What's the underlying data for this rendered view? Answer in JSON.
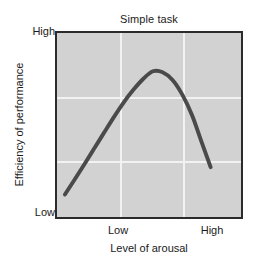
{
  "chart_data": {
    "type": "line",
    "title": "Simple task",
    "xlabel": "Level of arousal",
    "ylabel": "Efficiency of performance",
    "xtick_labels": [
      "Low",
      "High"
    ],
    "ytick_labels": [
      "Low",
      "High"
    ],
    "ytick_low": "Low",
    "ytick_high": "High",
    "xtick_low": "Low",
    "xtick_high": "High",
    "xlim": [
      0,
      1
    ],
    "ylim": [
      0,
      1
    ],
    "grid": true,
    "grid_x_fractions": [
      0.3351,
      0.6702
    ],
    "grid_y_fractions": [
      0.3191,
      0.6596
    ],
    "legend": null,
    "annotations": [],
    "series": [
      {
        "name": "Simple task performance",
        "color": "#4a4a4a",
        "line_width": 4,
        "x": [
          0.043,
          0.096,
          0.149,
          0.202,
          0.255,
          0.309,
          0.362,
          0.415,
          0.468,
          0.521,
          0.574,
          0.628,
          0.681,
          0.734,
          0.787,
          0.835
        ],
        "y": [
          0.122,
          0.204,
          0.287,
          0.372,
          0.457,
          0.543,
          0.622,
          0.691,
          0.75,
          0.792,
          0.787,
          0.745,
          0.665,
          0.553,
          0.404,
          0.271
        ],
        "peak": {
          "x": 0.59,
          "y": 0.793
        }
      }
    ]
  },
  "figure": {
    "background_color": "#ffffff",
    "plot_background_color": "#d2d2d2",
    "plot_border_color": "#2b2b2b",
    "gridline_color": "#f2f2f2",
    "curve_color": "#4a4a4a"
  }
}
